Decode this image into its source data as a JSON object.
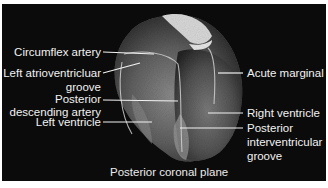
{
  "figure": {
    "caption": "Posterior coronal plane",
    "background_color": "#0b0b0b",
    "label_color": "#f2f2f2",
    "labels_left": [
      {
        "id": "circumflex",
        "lines": [
          "Circumflex artery"
        ]
      },
      {
        "id": "left-av-groove",
        "lines": [
          "Left atrioventricluar",
          "groove"
        ]
      },
      {
        "id": "posterior-descending",
        "lines": [
          "Posterior",
          "descending artery"
        ]
      },
      {
        "id": "left-ventricle",
        "lines": [
          "Left ventricle"
        ]
      }
    ],
    "labels_right": [
      {
        "id": "acute-marginal",
        "lines": [
          "Acute marginal"
        ]
      },
      {
        "id": "right-ventricle",
        "lines": [
          "Right ventricle"
        ]
      },
      {
        "id": "posterior-iv-groove",
        "lines": [
          "Posterior",
          "interventricular",
          "groove"
        ]
      }
    ]
  }
}
